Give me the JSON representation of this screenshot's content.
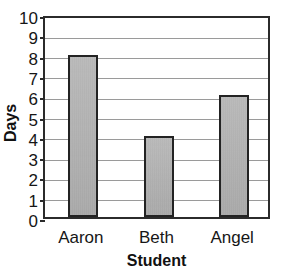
{
  "chart_data": {
    "type": "bar",
    "title": "Returned Class Books",
    "xlabel": "Student",
    "ylabel": "Days",
    "categories": [
      "Aaron",
      "Beth",
      "Angel"
    ],
    "values": [
      8,
      4,
      6
    ],
    "ylim": [
      0,
      10
    ],
    "ytick_labels": [
      "0",
      "1",
      "2",
      "3",
      "4",
      "5",
      "6",
      "7",
      "8",
      "9",
      "10"
    ],
    "grid": true,
    "legend": false,
    "bar_fill_color": "#b2b2b2",
    "bar_edge_color": "#232323",
    "gridline_color": "#9a9a9a",
    "frame_color": "#2b2b2b",
    "background_color": "#ffffff",
    "title_clipped": true
  }
}
